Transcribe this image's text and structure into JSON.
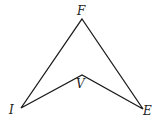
{
  "diagram": {
    "type": "concave-quadrilateral",
    "vertices": [
      {
        "id": "F",
        "label": "F",
        "x": 82,
        "y": 19
      },
      {
        "id": "E",
        "label": "E",
        "x": 143,
        "y": 109
      },
      {
        "id": "V",
        "label": "V",
        "x": 82,
        "y": 75
      },
      {
        "id": "I",
        "label": "I",
        "x": 21,
        "y": 108
      }
    ],
    "edges": [
      [
        "F",
        "E"
      ],
      [
        "E",
        "V"
      ],
      [
        "V",
        "I"
      ],
      [
        "I",
        "F"
      ]
    ],
    "line_color": "#1a1a1a"
  },
  "labels": {
    "F": "F",
    "V": "V",
    "I": "I",
    "E": "E"
  }
}
